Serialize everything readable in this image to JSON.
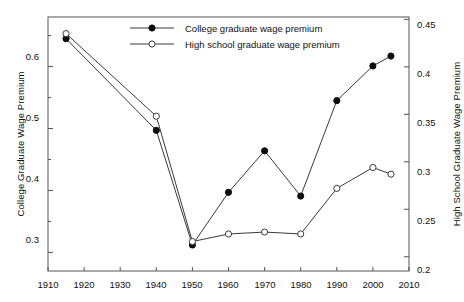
{
  "chart_data": {
    "type": "line",
    "title": "",
    "xlabel": "",
    "ylabel": "College Graduate Wage Premium",
    "y2label": "High School Graduate Wage Premium",
    "xlim": [
      1910,
      2010
    ],
    "ylim": [
      0.27,
      0.68
    ],
    "y2lim": [
      0.185,
      0.4525
    ],
    "xticks": [
      1910,
      1920,
      1930,
      1940,
      1950,
      1960,
      1970,
      1980,
      1990,
      2000,
      2010
    ],
    "yticks": [
      0.3,
      0.4,
      0.5,
      0.6
    ],
    "yticks_minor": [
      0.35,
      0.45,
      0.55,
      0.65
    ],
    "y2ticks": [
      0.2,
      0.25,
      0.3,
      0.35,
      0.4,
      0.45
    ],
    "grid": false,
    "legend_position": "top-center",
    "series": [
      {
        "name": "College graduate wage premium",
        "axis": "left",
        "marker": "filled-circle",
        "x": [
          1915,
          1940,
          1950,
          1960,
          1970,
          1980,
          1990,
          2000,
          2005
        ],
        "values": [
          0.645,
          0.497,
          0.312,
          0.397,
          0.464,
          0.391,
          0.545,
          0.601,
          0.617
        ]
      },
      {
        "name": "High school graduate wage premium",
        "axis": "right",
        "marker": "open-circle",
        "x": [
          1915,
          1940,
          1950,
          1960,
          1970,
          1980,
          1990,
          2000,
          2005
        ],
        "values": [
          0.435,
          0.348,
          0.216,
          0.224,
          0.226,
          0.224,
          0.272,
          0.294,
          0.287
        ]
      }
    ]
  },
  "axes": {
    "left_title": "College Graduate Wage Premium",
    "right_title": "High School Graduate Wage Premium",
    "left_ticks": [
      "0.6",
      "0.5",
      "0.4",
      "0.3"
    ],
    "right_ticks": [
      "0.45",
      "0.4",
      "0.35",
      "0.3",
      "0.25",
      "0.2"
    ],
    "x_ticks": [
      "1910",
      "1920",
      "1930",
      "1940",
      "1950",
      "1960",
      "1970",
      "1980",
      "1990",
      "2000",
      "2010"
    ]
  },
  "legend": {
    "items": [
      {
        "label": "College graduate wage premium",
        "marker": "filled-circle"
      },
      {
        "label": "High school graduate wage premium",
        "marker": "open-circle"
      }
    ]
  },
  "style": {
    "line_color": "#3a3a3a",
    "marker_fill": "#0d0d0d",
    "marker_open_fill": "#ffffff",
    "axis_color": "#555555",
    "text_color": "#111111"
  }
}
